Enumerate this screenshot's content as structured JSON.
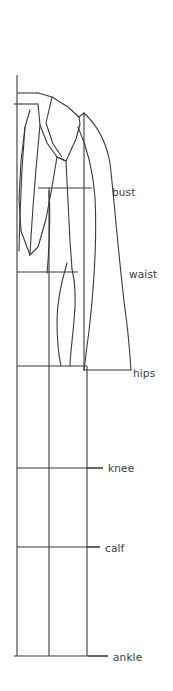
{
  "figure": {
    "stroke_color": "#3a3a3a",
    "label_color": "#3c3c3c",
    "background_color": "#ffffff",
    "line_width": 1.1
  },
  "measurement_labels": [
    {
      "id": "bust",
      "label": "bust",
      "x": 112,
      "y": 196,
      "leader_from_x": 92,
      "leader_to_x": 92,
      "leader_y": 188
    },
    {
      "id": "waist",
      "label": "waist",
      "x": 129,
      "y": 278,
      "leader_from_x": 78,
      "leader_to_x": 78,
      "leader_y": 272
    },
    {
      "id": "hips",
      "label": "hips",
      "x": 133,
      "y": 377,
      "leader_from_x": 128,
      "leader_to_x": 128,
      "leader_y": 370
    },
    {
      "id": "knee",
      "label": "knee",
      "x": 108,
      "y": 472,
      "leader_from_x": 87,
      "leader_to_x": 103,
      "leader_y": 468
    },
    {
      "id": "calf",
      "label": "calf",
      "x": 105,
      "y": 552,
      "leader_from_x": 86,
      "leader_to_x": 100,
      "leader_y": 547
    },
    {
      "id": "ankle",
      "label": "ankle",
      "x": 113,
      "y": 661,
      "leader_from_x": 88,
      "leader_to_x": 108,
      "leader_y": 656
    }
  ],
  "guide_lines": {
    "vertical": [
      {
        "id": "center-front-guide",
        "x": 17,
        "y1": 75,
        "y2": 656
      },
      {
        "id": "center-body-guide",
        "x": 49,
        "y1": 366,
        "y2": 656
      },
      {
        "id": "center-back-guide",
        "x": 87,
        "y1": 366,
        "y2": 656
      }
    ],
    "horizontal": [
      {
        "id": "shoulder-line",
        "y": 93,
        "x1": 17,
        "x2": 38
      },
      {
        "id": "neck-line",
        "y": 104,
        "x1": 14,
        "x2": 38
      },
      {
        "id": "bust-line",
        "y": 188,
        "x1": 38,
        "x2": 92
      },
      {
        "id": "waist-line",
        "y": 272,
        "x1": 17,
        "x2": 78
      },
      {
        "id": "hips-line",
        "y": 366,
        "x1": 17,
        "x2": 87
      },
      {
        "id": "knee-line",
        "y": 468,
        "x1": 17,
        "x2": 103
      },
      {
        "id": "calf-line",
        "y": 547,
        "x1": 17,
        "x2": 100
      },
      {
        "id": "ankle-line",
        "y": 656,
        "x1": 14,
        "x2": 108
      }
    ]
  },
  "garment_paths": {
    "coat_outer_back": "M 84 113 C 96 124 106 140 110 162 C 114 196 118 260 124 308 C 128 336 130 356 131 370",
    "coat_hem": "M 84 370 L 131 370",
    "coat_front_edge": "M 84 113 L 84 370",
    "coat_back_inner": "M 78 128 C 86 146 92 170 94 196 C 96 236 94 286 89 330 C 86 352 85 362 84 370",
    "shoulder_seam": "M 38 93 L 50 97 L 66 106 L 78 116 L 84 113",
    "lapel_outer": "M 38 104 L 40 124 L 47 142 L 57 156 L 66 160 L 76 138 L 80 123 L 78 116",
    "lapel_fold": "M 50 97 L 46 122 L 52 143 L 62 156",
    "lapel_notch": "M 66 160 L 57 156",
    "front_opening": "M 40 124 L 36 168 L 33 206 L 31 236 L 30 254",
    "coat_front_hem_left": "M 30 254 L 20 230 L 19 198 L 21 160 L 25 126 L 29 110",
    "body_front_torso": "M 25 126 L 22 168 L 20 214 L 19 250",
    "jacket_front_panel": "M 57 156 L 52 186 L 46 218 L 38 246 L 30 254",
    "arm_inner_line": "M 66 160 L 68 200 L 70 240 L 72 268",
    "leg_front_contour": "M 72 268 C 76 284 76 300 74 320 C 72 342 70 356 70 366",
    "leg_back_contour": "M 66 262 C 60 282 56 300 56 320 C 56 342 58 356 60 366",
    "hip_curve": "M 49 190 C 50 222 48 250 46 272",
    "thigh_line": "M 84 196 C 86 228 84 258 80 286"
  }
}
